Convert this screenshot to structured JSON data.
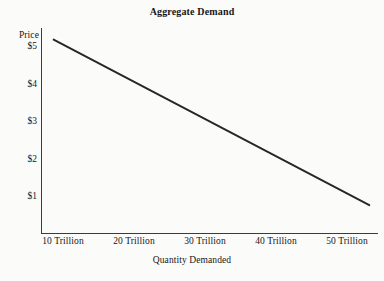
{
  "chart_data": {
    "type": "line",
    "title": "Aggregate Demand",
    "xlabel": "Quantity Demanded",
    "ylabel": "Price",
    "grid": false,
    "legend": "none",
    "x": [
      "10 Trillion",
      "20 Trillion",
      "30 Trillion",
      "40 Trillion",
      "50 Trillion"
    ],
    "x_numeric": [
      10,
      20,
      30,
      40,
      50
    ],
    "xlim": [
      8.4,
      51.1
    ],
    "y_ticks": [
      "$1",
      "$2",
      "$3",
      "$4",
      "$5"
    ],
    "y_numeric": [
      1,
      2,
      3,
      4,
      5
    ],
    "ylim": [
      0.0,
      5.3
    ],
    "series": [
      {
        "name": "Aggregate Demand",
        "color": "#262626",
        "values": [
          5.0,
          3.93,
          2.86,
          1.79,
          0.72
        ],
        "endpoints": [
          {
            "x": 10,
            "y": 5.0
          },
          {
            "x": 50,
            "y": 0.72
          }
        ]
      }
    ],
    "annotations": []
  },
  "chart": {
    "title": "Aggregate Demand",
    "y_axis": {
      "label": "Price",
      "ticks": [
        {
          "label": "$5",
          "top": 41
        },
        {
          "label": "$4",
          "top": 78.6
        },
        {
          "label": "$3",
          "top": 116.2
        },
        {
          "label": "$2",
          "top": 153.8
        },
        {
          "label": "$1",
          "top": 191.4
        }
      ]
    },
    "x_axis": {
      "label": "Quantity Demanded",
      "ticks": [
        {
          "label": "10 Trillion",
          "left": 27
        },
        {
          "label": "20 Trillion",
          "left": 98
        },
        {
          "label": "30 Trillion",
          "left": 169
        },
        {
          "label": "40 Trillion",
          "left": 240
        },
        {
          "label": "50 Trillion",
          "left": 311
        }
      ]
    },
    "colors": {
      "background": "#fbfbf9",
      "axis": "#3b3b3b",
      "line": "#262626",
      "text": "#16161a"
    }
  }
}
